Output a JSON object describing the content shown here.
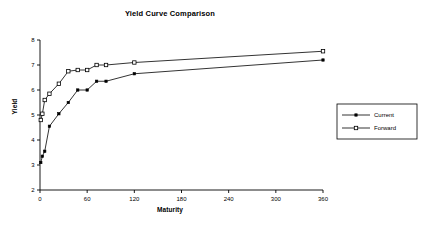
{
  "chart_data": {
    "type": "line",
    "title": "Yield Curve Comparison",
    "xlabel": "Maturity",
    "ylabel": "Yield",
    "xlim": [
      0,
      360
    ],
    "ylim": [
      2,
      8
    ],
    "xticks": [
      0,
      60,
      120,
      180,
      240,
      300,
      360
    ],
    "yticks": [
      2,
      3,
      4,
      5,
      6,
      7,
      8
    ],
    "grid": false,
    "legend_position": "right-outside",
    "series": [
      {
        "name": "Current",
        "marker": "filled-square",
        "color": "#000000",
        "x": [
          1,
          3,
          6,
          12,
          24,
          36,
          48,
          60,
          72,
          84,
          120,
          360
        ],
        "y": [
          3.1,
          3.35,
          3.55,
          4.55,
          5.05,
          5.5,
          6.0,
          6.0,
          6.35,
          6.35,
          6.65,
          7.2
        ]
      },
      {
        "name": "Forward",
        "marker": "open-square",
        "color": "#000000",
        "x": [
          1,
          3,
          6,
          12,
          24,
          36,
          48,
          60,
          72,
          84,
          120,
          360
        ],
        "y": [
          4.8,
          5.05,
          5.6,
          5.85,
          6.25,
          6.75,
          6.8,
          6.8,
          7.0,
          7.0,
          7.1,
          7.55
        ]
      }
    ]
  },
  "legend": {
    "entries": [
      {
        "label": "Current"
      },
      {
        "label": "Forward"
      }
    ]
  },
  "axes": {
    "x_tick_labels": [
      "0",
      "60",
      "120",
      "180",
      "240",
      "300",
      "360"
    ],
    "y_tick_labels": [
      "2",
      "3",
      "4",
      "5",
      "6",
      "7",
      "8"
    ]
  }
}
